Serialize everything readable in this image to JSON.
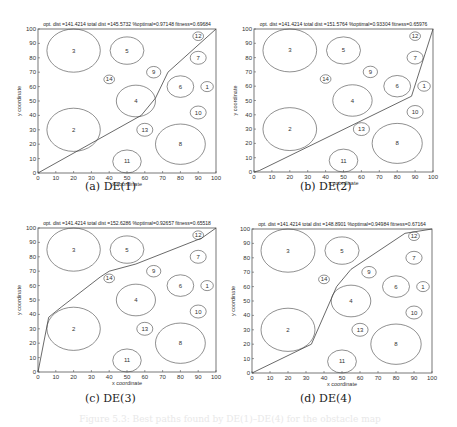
{
  "chart_data": [
    {
      "type": "line",
      "panel": "a",
      "caption": "(a) DE(1)",
      "title": "opt. dist =141.4214 total dist =145.5732 %optimal=0.97148 fitness=0.69684",
      "xlabel": "x coordinate",
      "ylabel": "y coordinate",
      "xlim": [
        0,
        100
      ],
      "ylim": [
        0,
        100
      ],
      "xticks": [
        0,
        10,
        20,
        30,
        40,
        50,
        60,
        70,
        80,
        90,
        100
      ],
      "yticks": [
        0,
        10,
        20,
        30,
        40,
        50,
        60,
        70,
        80,
        90,
        100
      ],
      "grid": false,
      "path": [
        [
          0,
          0
        ],
        [
          58,
          40
        ],
        [
          66,
          52
        ],
        [
          73,
          70
        ],
        [
          100,
          100
        ]
      ]
    },
    {
      "type": "line",
      "panel": "b",
      "caption": "(b) DE(2)",
      "title": "opt. dist =141.4214 total dist =151.5764 %optimal=0.93304 fitness=0.65976",
      "xlabel": "x coordinate",
      "ylabel": "y coordinate",
      "xlim": [
        0,
        100
      ],
      "ylim": [
        0,
        100
      ],
      "xticks": [
        0,
        10,
        20,
        30,
        40,
        50,
        60,
        70,
        80,
        90,
        100
      ],
      "yticks": [
        0,
        10,
        20,
        30,
        40,
        50,
        60,
        70,
        80,
        90,
        100
      ],
      "grid": false,
      "path": [
        [
          0,
          0
        ],
        [
          3,
          1
        ],
        [
          88,
          53
        ],
        [
          100,
          100
        ]
      ]
    },
    {
      "type": "line",
      "panel": "c",
      "caption": "(c) DE(3)",
      "title": "opt. dist =141.4214 total dist =152.6286 %optimal=0.92657 fitness=0.65518",
      "xlabel": "x coordinate",
      "ylabel": "y coordinate",
      "xlim": [
        0,
        100
      ],
      "ylim": [
        0,
        100
      ],
      "xticks": [
        0,
        10,
        20,
        30,
        40,
        50,
        60,
        70,
        80,
        90,
        100
      ],
      "yticks": [
        0,
        10,
        20,
        30,
        40,
        50,
        60,
        70,
        80,
        90,
        100
      ],
      "grid": false,
      "path": [
        [
          0,
          0
        ],
        [
          6,
          38
        ],
        [
          13,
          45
        ],
        [
          35,
          66
        ],
        [
          40,
          70
        ],
        [
          55,
          75
        ],
        [
          92,
          93
        ],
        [
          100,
          100
        ]
      ]
    },
    {
      "type": "line",
      "panel": "d",
      "caption": "(d) DE(4)",
      "title": "opt. dist =141.4214 total dist =148.8901 %optimal=0.94984 fitness=0.67164",
      "xlabel": "x coordinate",
      "ylabel": "y coordinate",
      "xlim": [
        0,
        100
      ],
      "ylim": [
        0,
        100
      ],
      "xticks": [
        0,
        10,
        20,
        30,
        40,
        50,
        60,
        70,
        80,
        90,
        100
      ],
      "yticks": [
        0,
        10,
        20,
        30,
        40,
        50,
        60,
        70,
        80,
        90,
        100
      ],
      "grid": false,
      "path": [
        [
          0,
          0
        ],
        [
          33,
          20
        ],
        [
          47,
          60
        ],
        [
          55,
          72
        ],
        [
          85,
          97
        ],
        [
          100,
          100
        ]
      ]
    }
  ],
  "obstacles": [
    {
      "id": "1",
      "cx": 95,
      "cy": 60,
      "r": 3.5
    },
    {
      "id": "2",
      "cx": 20,
      "cy": 30,
      "r": 15
    },
    {
      "id": "3",
      "cx": 20,
      "cy": 85,
      "r": 15
    },
    {
      "id": "4",
      "cx": 55,
      "cy": 50,
      "r": 11
    },
    {
      "id": "5",
      "cx": 50,
      "cy": 85,
      "r": 9.5
    },
    {
      "id": "6",
      "cx": 80,
      "cy": 60,
      "r": 7.5
    },
    {
      "id": "7",
      "cx": 90,
      "cy": 80,
      "r": 4.5
    },
    {
      "id": "8",
      "cx": 80,
      "cy": 20,
      "r": 14
    },
    {
      "id": "9",
      "cx": 65,
      "cy": 70,
      "r": 4
    },
    {
      "id": "10",
      "cx": 90,
      "cy": 42,
      "r": 4.5
    },
    {
      "id": "11",
      "cx": 50,
      "cy": 8,
      "r": 8
    },
    {
      "id": "12",
      "cx": 90,
      "cy": 95,
      "r": 3
    },
    {
      "id": "13",
      "cx": 60,
      "cy": 30,
      "r": 4.5
    },
    {
      "id": "14",
      "cx": 40,
      "cy": 65,
      "r": 3
    }
  ],
  "panels_layout": [
    {
      "panel": "a",
      "left": 38,
      "top": 29,
      "width": 178,
      "height": 144,
      "caption_x": 85,
      "caption_y": 180
    },
    {
      "panel": "b",
      "left": 254,
      "top": 29,
      "width": 179,
      "height": 143,
      "caption_x": 300,
      "caption_y": 180
    },
    {
      "panel": "c",
      "left": 38,
      "top": 228,
      "width": 178,
      "height": 144,
      "caption_x": 85,
      "caption_y": 392
    },
    {
      "panel": "d",
      "left": 252,
      "top": 229,
      "width": 180,
      "height": 144,
      "caption_x": 300,
      "caption_y": 392
    }
  ],
  "colors": {
    "line": "#444444",
    "axis": "#555555",
    "text": "#222222",
    "background": "#ffffff"
  },
  "figure_caption": "Figure 5.3: Best paths found by DE(1)–DE(4) for the obstacle map"
}
